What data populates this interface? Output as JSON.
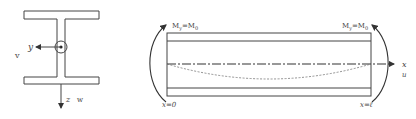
{
  "cross_section": {
    "y_axis_label": "y",
    "v_label": "v",
    "z_axis_label": "z",
    "w_label": "w"
  },
  "beam": {
    "left_moment_label": "M",
    "left_moment_sub": "y",
    "left_moment_eq": "=M",
    "left_moment_sub2": "0",
    "right_moment_label": "M",
    "right_moment_sub": "y",
    "right_moment_eq": "=M",
    "right_moment_sub2": "0",
    "x_axis_label": "x",
    "u_label": "u",
    "left_end_label": "x=0",
    "right_end_label": "x=ℓ"
  },
  "colors": {
    "line": "#444444",
    "dashed": "#666666"
  }
}
